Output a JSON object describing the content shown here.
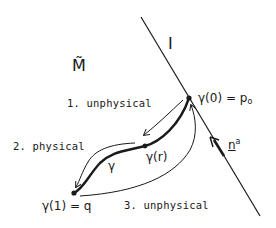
{
  "diagram": {
    "manifold_label": "M̃",
    "boundary_label": "I",
    "normal_label": "n",
    "normal_superscript": "a",
    "points": {
      "start": {
        "label": "γ(0) = p",
        "subscript": "o"
      },
      "mid": {
        "label": "γ(r)"
      },
      "end": {
        "label": "γ(1) = q"
      }
    },
    "curve_label": "γ",
    "paths": [
      {
        "label": "1. unphysical"
      },
      {
        "label": "2. physical"
      },
      {
        "label": "3. unphysical"
      }
    ],
    "colors": {
      "ink": "#1a1a1a",
      "background": "#ffffff"
    }
  }
}
